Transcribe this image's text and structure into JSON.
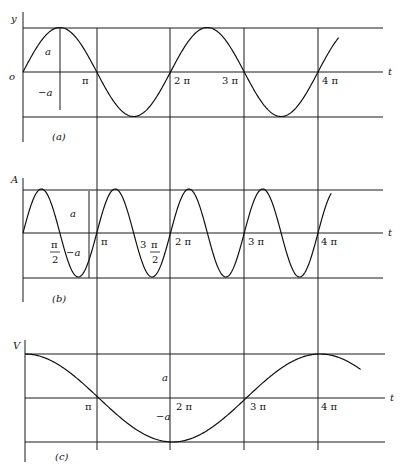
{
  "figure": {
    "panels": [
      {
        "id": "a",
        "caption": "(a)",
        "y_label": "y",
        "x_label": "t",
        "origin_label": "o",
        "amp_pos_label": "a",
        "amp_neg_label": "−a",
        "ticks": [
          "π",
          "2 π",
          "3 π",
          "4 π"
        ],
        "function": "sin(t)"
      },
      {
        "id": "b",
        "caption": "(b)",
        "y_label": "A",
        "x_label": "t",
        "amp_pos_label": "a",
        "amp_neg_label": "−a",
        "ticks": [
          "π",
          "2 π",
          "3 π",
          "4 π"
        ],
        "half_ticks": [
          {
            "num": "π",
            "den": "2",
            "prefix": ""
          },
          {
            "num": "π",
            "den": "2",
            "prefix": "3"
          }
        ],
        "function": "sin(2t)"
      },
      {
        "id": "c",
        "caption": "(c)",
        "y_label": "V",
        "x_label": "t",
        "amp_pos_label": "a",
        "amp_neg_label": "−a",
        "ticks": [
          "π",
          "2 π",
          "3 π",
          "4 π"
        ],
        "function": "cos(t/2)"
      }
    ]
  },
  "chart_data": [
    {
      "type": "line",
      "title": "(a)",
      "xlabel": "t",
      "ylabel": "y",
      "x_ticks": [
        "0",
        "π",
        "2π",
        "3π",
        "4π"
      ],
      "y_levels": [
        "a",
        "0",
        "−a"
      ],
      "series": [
        {
          "name": "y = a sin t",
          "x": [
            0,
            0.5,
            1,
            1.5,
            2,
            2.5,
            3,
            3.5,
            4,
            4.25
          ],
          "x_unit": "π",
          "values": [
            0,
            1,
            0,
            -1,
            0,
            1,
            0,
            -1,
            0,
            0.71
          ]
        }
      ],
      "grid": true
    },
    {
      "type": "line",
      "title": "(b)",
      "xlabel": "t",
      "ylabel": "A",
      "x_ticks": [
        "π/2",
        "π",
        "3π/2",
        "2π",
        "3π",
        "4π"
      ],
      "y_levels": [
        "a",
        "0",
        "−a"
      ],
      "series": [
        {
          "name": "A = a sin 2t",
          "x": [
            0,
            0.25,
            0.5,
            0.75,
            1,
            1.25,
            1.5,
            1.75,
            2,
            2.5,
            3,
            3.5,
            4,
            4.25
          ],
          "x_unit": "π",
          "values": [
            0,
            1,
            0,
            -1,
            0,
            1,
            0,
            -1,
            0,
            0,
            0,
            0,
            0,
            1
          ]
        }
      ],
      "grid": true
    },
    {
      "type": "line",
      "title": "(c)",
      "xlabel": "t",
      "ylabel": "V",
      "x_ticks": [
        "π",
        "2π",
        "3π",
        "4π"
      ],
      "y_levels": [
        "a",
        "0",
        "−a"
      ],
      "series": [
        {
          "name": "V = a cos(t/2)",
          "x": [
            0,
            1,
            2,
            3,
            4,
            4.5
          ],
          "x_unit": "π",
          "values": [
            1,
            0,
            -1,
            0,
            1,
            0.92
          ]
        }
      ],
      "grid": true
    }
  ]
}
